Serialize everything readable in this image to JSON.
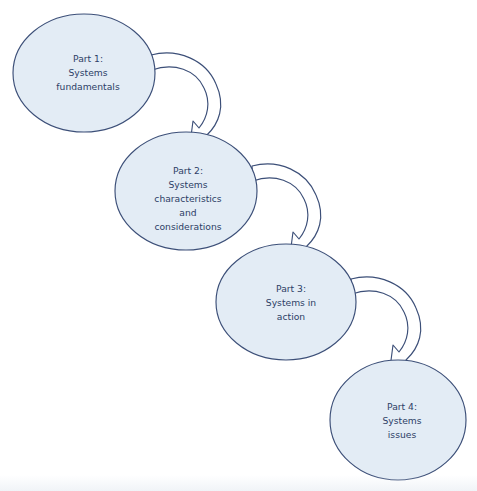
{
  "diagram": {
    "type": "flow-cycle",
    "title": "",
    "background_color": "#ffffff",
    "node_fill_color": "#e3ecf5",
    "node_stroke_color": "#3c4f78",
    "text_color": "#2d3e66",
    "arrow_fill_color": "#ffffff",
    "arrow_stroke_color": "#3c4f78",
    "nodes": [
      {
        "id": "part-1",
        "shape": "ellipse",
        "cx": 84,
        "cy": 73,
        "rx": 71,
        "ry": 59,
        "lines": [
          "Part 1:",
          "Systems",
          "fundamentals"
        ]
      },
      {
        "id": "part-2",
        "shape": "ellipse",
        "cx": 186,
        "cy": 191,
        "rx": 71,
        "ry": 59,
        "lines": [
          "Part 2:",
          "Systems",
          "characteristics",
          "and",
          "considerations"
        ]
      },
      {
        "id": "part-3",
        "shape": "ellipse",
        "cx": 286,
        "cy": 302,
        "rx": 70,
        "ry": 58,
        "lines": [
          "Part 3:",
          "Systems in",
          "action"
        ]
      },
      {
        "id": "part-4",
        "shape": "ellipse",
        "cx": 398,
        "cy": 420,
        "rx": 68,
        "ry": 60,
        "lines": [
          "Part 4:",
          "Systems",
          "issues"
        ]
      }
    ],
    "connectors": [
      {
        "id": "arrow-1-to-2",
        "from": "part-1",
        "to": "part-2",
        "style": "curved-hook-arrow"
      },
      {
        "id": "arrow-2-to-3",
        "from": "part-2",
        "to": "part-3",
        "style": "curved-hook-arrow"
      },
      {
        "id": "arrow-3-to-4",
        "from": "part-3",
        "to": "part-4",
        "style": "curved-hook-arrow"
      }
    ]
  }
}
